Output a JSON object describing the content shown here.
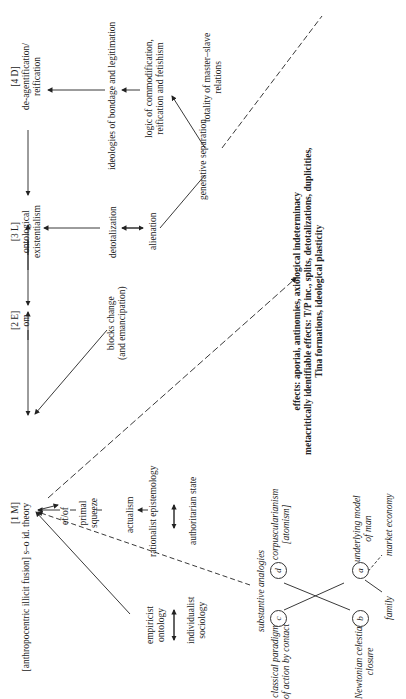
{
  "header": {
    "page_number": ""
  },
  "nodes": {
    "m1": {
      "tag": "[1 M]",
      "line1": "[anthropocentric illicit fusion] s–o id. theory"
    },
    "e2": {
      "tag": "[2 E]",
      "line1": "om"
    },
    "l3": {
      "tag": "[3 L]",
      "line1": "ontological",
      "line2": "existentialism"
    },
    "d4": {
      "tag": "[4 D]",
      "line1": "de-agentification/",
      "line2": "reification"
    }
  },
  "labels": {
    "blocks_change": [
      "blocks change",
      "(and emancipation)"
    ],
    "detotalization": "detotalization",
    "alienation": "alienation",
    "ideologies": "ideologies of bondage and legitimation",
    "logic_commod": [
      "logic of commodification,",
      "reification and fetishism"
    ],
    "generative_sep": "generative separation",
    "totality": [
      "totality of master–slave",
      "relations"
    ],
    "efof": "ef/of",
    "primal_squeeze": [
      "primal",
      "squeeze"
    ],
    "actualism": "actualism",
    "rationalist": "rationalist epistemology",
    "authoritarian": "authoritarian state",
    "empiricist": [
      "empiricist",
      "ontology"
    ],
    "individualist": [
      "individualist",
      "sociology"
    ],
    "substantive": "substantive analogies",
    "classical": [
      "classical paradigm",
      "of action by contact"
    ],
    "newtonian": [
      "Newtonian celestial",
      "closure"
    ],
    "corpuscularianism": [
      "corpuscularianism",
      "[atomism]"
    ],
    "underlying": [
      "underlying model",
      "of man"
    ],
    "family": "family",
    "market": "market economy"
  },
  "effects": [
    "effects: aporiai, antinomies, axiological indeterminacy",
    "metacritically identifiable effects: T/P inc., splits, detotalizations, duplicities,",
    "Tina formations, ideological plasticity"
  ],
  "circles": {
    "a": "a",
    "b": "b",
    "c": "c",
    "d": "d"
  }
}
